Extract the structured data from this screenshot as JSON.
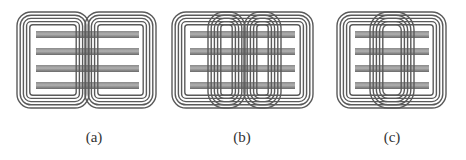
{
  "figure": {
    "colors": {
      "coil_stroke": "#5a5a5a",
      "bar_dark": "#6e6e6e",
      "bar_light": "#a8a8a8",
      "background": "#ffffff"
    },
    "panels": [
      {
        "id": "a",
        "label": "(a)",
        "bars": 4,
        "outer_coils": 2,
        "inner_coils": 0,
        "turns_per_coil": 5
      },
      {
        "id": "b",
        "label": "(b)",
        "bars": 4,
        "outer_coils": 1,
        "inner_coils": 2,
        "turns_per_coil": 5
      },
      {
        "id": "c",
        "label": "(c)",
        "bars": 4,
        "outer_coils": 1,
        "inner_coils": 1,
        "turns_per_coil": 5
      }
    ]
  }
}
